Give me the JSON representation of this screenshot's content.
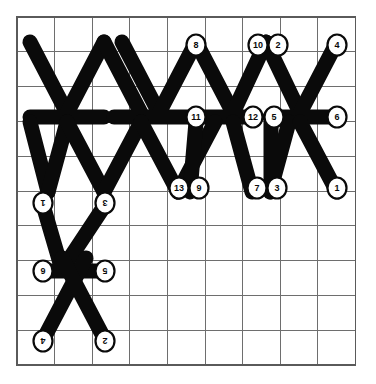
{
  "page": {
    "background_color": "#ffffff",
    "width": 376,
    "height": 384
  },
  "grid": {
    "name": "square-lattice",
    "origin_x": 17,
    "origin_y": 17,
    "cell_width": 37.6,
    "cell_height": 34.8,
    "columns": 9,
    "rows": 10,
    "line_color": "#6e6e6e",
    "border_color": "#5a5a5a",
    "show_grid": true
  },
  "style": {
    "stick_color": "#0a0a0a",
    "stick_width": 15,
    "node_fill": "#ffffff",
    "node_stroke": "#0a0a0a",
    "node_radius": 9.5,
    "label_color": "#0a0a0a"
  },
  "chart_data": {
    "type": "diagram",
    "xlabel": "",
    "ylabel": "",
    "grid": true,
    "legend": "none",
    "sticks": [
      {
        "id": "s1",
        "x1": 30,
        "y1": 42,
        "x2": 67,
        "y2": 113,
        "group": "upper-zigzag"
      },
      {
        "id": "s2",
        "x1": 67,
        "y1": 113,
        "x2": 104,
        "y2": 42,
        "group": "upper-zigzag"
      },
      {
        "id": "s3",
        "x1": 104,
        "y1": 42,
        "x2": 141,
        "y2": 113,
        "group": "upper-zigzag"
      },
      {
        "id": "s4",
        "x1": 122,
        "y1": 42,
        "x2": 159,
        "y2": 113,
        "group": "upper-zigzag"
      },
      {
        "id": "s5",
        "x1": 159,
        "y1": 113,
        "x2": 196,
        "y2": 42,
        "group": "upper-zigzag"
      },
      {
        "id": "s6",
        "x1": 196,
        "y1": 42,
        "x2": 233,
        "y2": 113,
        "group": "upper-zigzag"
      },
      {
        "id": "s7",
        "x1": 233,
        "y1": 113,
        "x2": 266,
        "y2": 42,
        "group": "upper-zigzag"
      },
      {
        "id": "s8",
        "x1": 266,
        "y1": 42,
        "x2": 300,
        "y2": 113,
        "group": "upper-zigzag"
      },
      {
        "id": "s9",
        "x1": 300,
        "y1": 113,
        "x2": 337,
        "y2": 42,
        "group": "upper-zigzag"
      },
      {
        "id": "h1",
        "x1": 30,
        "y1": 117,
        "x2": 104,
        "y2": 117,
        "group": "horizontal-row"
      },
      {
        "id": "h2",
        "x1": 114,
        "y1": 117,
        "x2": 188,
        "y2": 117,
        "group": "horizontal-row"
      },
      {
        "id": "h3",
        "x1": 196,
        "y1": 117,
        "x2": 252,
        "y2": 117,
        "group": "horizontal-row"
      },
      {
        "id": "h4",
        "x1": 270,
        "y1": 117,
        "x2": 337,
        "y2": 117,
        "group": "horizontal-row"
      },
      {
        "id": "s10",
        "x1": 30,
        "y1": 122,
        "x2": 48,
        "y2": 192,
        "group": "lower-zigzag"
      },
      {
        "id": "s11",
        "x1": 67,
        "y1": 122,
        "x2": 48,
        "y2": 192,
        "group": "lower-zigzag"
      },
      {
        "id": "s12",
        "x1": 67,
        "y1": 122,
        "x2": 104,
        "y2": 192,
        "group": "lower-zigzag"
      },
      {
        "id": "s13",
        "x1": 104,
        "y1": 192,
        "x2": 141,
        "y2": 122,
        "group": "lower-zigzag"
      },
      {
        "id": "s14",
        "x1": 141,
        "y1": 122,
        "x2": 178,
        "y2": 192,
        "group": "lower-zigzag"
      },
      {
        "id": "s15",
        "x1": 178,
        "y1": 192,
        "x2": 215,
        "y2": 122,
        "group": "lower-zigzag"
      },
      {
        "id": "s16",
        "x1": 196,
        "y1": 122,
        "x2": 190,
        "y2": 192,
        "group": "lower-zigzag"
      },
      {
        "id": "s17",
        "x1": 233,
        "y1": 122,
        "x2": 252,
        "y2": 192,
        "group": "lower-zigzag"
      },
      {
        "id": "s18",
        "x1": 270,
        "y1": 192,
        "x2": 289,
        "y2": 122,
        "group": "lower-zigzag"
      },
      {
        "id": "s19",
        "x1": 271,
        "y1": 122,
        "x2": 271,
        "y2": 192,
        "group": "lower-zigzag"
      },
      {
        "id": "s20",
        "x1": 300,
        "y1": 122,
        "x2": 337,
        "y2": 192,
        "group": "lower-zigzag"
      },
      {
        "id": "b1",
        "x1": 43,
        "y1": 205,
        "x2": 62,
        "y2": 270,
        "group": "bottom-cluster"
      },
      {
        "id": "b2",
        "x1": 105,
        "y1": 205,
        "x2": 62,
        "y2": 270,
        "group": "bottom-cluster"
      },
      {
        "id": "b3",
        "x1": 43,
        "y1": 271,
        "x2": 105,
        "y2": 271,
        "group": "bottom-cluster"
      },
      {
        "id": "b4",
        "x1": 43,
        "y1": 340,
        "x2": 86,
        "y2": 258,
        "group": "bottom-cluster"
      },
      {
        "id": "b5",
        "x1": 105,
        "y1": 340,
        "x2": 62,
        "y2": 258,
        "group": "bottom-cluster"
      }
    ],
    "nodes": [
      {
        "label": "8",
        "x": 196,
        "y": 45,
        "rotated": false,
        "row": "top"
      },
      {
        "label": "10",
        "x": 258,
        "y": 45,
        "rotated": false,
        "row": "top"
      },
      {
        "label": "2",
        "x": 278,
        "y": 45,
        "rotated": false,
        "row": "top"
      },
      {
        "label": "4",
        "x": 337,
        "y": 45,
        "rotated": false,
        "row": "top"
      },
      {
        "label": "11",
        "x": 196,
        "y": 117,
        "rotated": false,
        "row": "middle"
      },
      {
        "label": "12",
        "x": 253,
        "y": 117,
        "rotated": false,
        "row": "middle"
      },
      {
        "label": "5",
        "x": 274,
        "y": 117,
        "rotated": false,
        "row": "middle"
      },
      {
        "label": "6",
        "x": 337,
        "y": 117,
        "rotated": false,
        "row": "middle"
      },
      {
        "label": "13",
        "x": 179,
        "y": 188,
        "rotated": false,
        "row": "third"
      },
      {
        "label": "9",
        "x": 199,
        "y": 188,
        "rotated": false,
        "row": "third"
      },
      {
        "label": "7",
        "x": 257,
        "y": 188,
        "rotated": false,
        "row": "third"
      },
      {
        "label": "3",
        "x": 277,
        "y": 188,
        "rotated": false,
        "row": "third"
      },
      {
        "label": "1",
        "x": 337,
        "y": 188,
        "rotated": false,
        "row": "third"
      },
      {
        "label": "1",
        "x": 43,
        "y": 203,
        "rotated": true,
        "row": "cluster-top"
      },
      {
        "label": "3",
        "x": 105,
        "y": 203,
        "rotated": true,
        "row": "cluster-top"
      },
      {
        "label": "6",
        "x": 43,
        "y": 271,
        "rotated": true,
        "row": "cluster-mid"
      },
      {
        "label": "5",
        "x": 105,
        "y": 271,
        "rotated": true,
        "row": "cluster-mid"
      },
      {
        "label": "4",
        "x": 43,
        "y": 341,
        "rotated": true,
        "row": "cluster-bottom"
      },
      {
        "label": "2",
        "x": 105,
        "y": 341,
        "rotated": true,
        "row": "cluster-bottom"
      }
    ]
  }
}
